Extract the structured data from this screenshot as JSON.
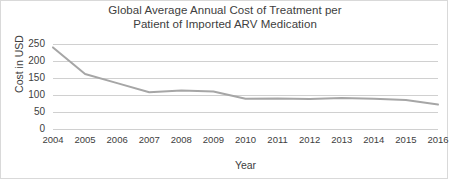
{
  "chart_data": {
    "type": "line",
    "title": "Global Average Annual Cost of Treatment per Patient of Imported ARV Medication",
    "title_lines": [
      "Global Average Annual Cost of Treatment per",
      "Patient of Imported ARV Medication"
    ],
    "xlabel": "Year",
    "ylabel": "Cost in USD",
    "categories": [
      "2004",
      "2005",
      "2006",
      "2007",
      "2008",
      "2009",
      "2010",
      "2011",
      "2012",
      "2013",
      "2014",
      "2015",
      "2016"
    ],
    "values": [
      240,
      162,
      135,
      108,
      113,
      110,
      89,
      90,
      88,
      91,
      89,
      85,
      72
    ],
    "series": [
      {
        "name": "Average annual cost per patient",
        "values": [
          240,
          162,
          135,
          108,
          113,
          110,
          89,
          90,
          88,
          91,
          89,
          85,
          72
        ],
        "color": "#a6a6a6"
      }
    ],
    "ylim": [
      0,
      250
    ],
    "yticks": [
      0,
      50,
      100,
      150,
      200,
      250
    ],
    "ytick_labels": [
      "0",
      "50",
      "100",
      "150",
      "200",
      "250"
    ],
    "xlim": [
      "2004",
      "2016"
    ],
    "grid": "horizontal",
    "legend": "none",
    "line_color": "#a6a6a6",
    "grid_color": "#d0d0d0",
    "text_color": "#404040",
    "background": "#ffffff"
  }
}
